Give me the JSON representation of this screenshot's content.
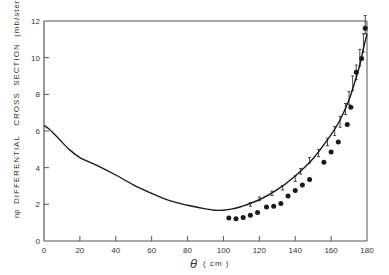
{
  "chart_data": {
    "type": "line",
    "title": "",
    "xlabel": "θ (cm)",
    "ylabel": "np DIFFERENTIAL CROSS SECTION (mb/ster.)",
    "xlim": [
      0,
      180
    ],
    "ylim": [
      0,
      12
    ],
    "x_ticks": [
      "0",
      "20",
      "40",
      "60",
      "80",
      "100",
      "120",
      "140",
      "160",
      "180"
    ],
    "y_ticks": [
      "0",
      "2",
      "4",
      "6",
      "8",
      "10",
      "12"
    ],
    "grid": false,
    "legend": null,
    "series": [
      {
        "name": "theory curve",
        "kind": "line",
        "x": [
          0,
          3,
          8,
          14,
          20,
          30,
          40,
          50,
          60,
          70,
          80,
          90,
          95,
          100,
          105,
          110,
          120,
          130,
          140,
          150,
          160,
          165,
          170,
          173,
          176,
          178,
          180
        ],
        "y": [
          6.3,
          6.1,
          5.6,
          5.0,
          4.55,
          4.1,
          3.6,
          3.05,
          2.6,
          2.2,
          1.95,
          1.75,
          1.68,
          1.68,
          1.75,
          1.88,
          2.25,
          2.8,
          3.55,
          4.5,
          5.8,
          6.6,
          7.7,
          8.6,
          9.6,
          10.5,
          11.3
        ]
      },
      {
        "name": "open points (error bars)",
        "kind": "errorbar",
        "x": [
          115,
          120,
          127,
          133,
          140,
          143,
          148,
          153,
          158,
          162,
          165,
          168,
          170,
          172,
          174,
          176,
          178,
          179
        ],
        "y": [
          2.0,
          2.3,
          2.6,
          2.9,
          3.4,
          3.8,
          4.4,
          4.8,
          5.4,
          6.0,
          6.5,
          7.2,
          7.8,
          8.6,
          9.2,
          10.0,
          10.8,
          11.8
        ],
        "err": [
          0.1,
          0.1,
          0.12,
          0.12,
          0.15,
          0.15,
          0.15,
          0.2,
          0.2,
          0.25,
          0.3,
          0.3,
          0.35,
          0.4,
          0.4,
          0.45,
          0.5,
          0.5
        ]
      },
      {
        "name": "filled points",
        "kind": "scatter",
        "x": [
          103,
          107,
          111,
          115,
          119,
          124,
          128,
          132,
          136,
          140,
          144,
          148,
          156,
          160,
          164,
          169,
          171,
          174,
          177,
          179
        ],
        "y": [
          1.25,
          1.22,
          1.28,
          1.4,
          1.55,
          1.85,
          1.9,
          2.05,
          2.45,
          2.75,
          3.05,
          3.35,
          4.3,
          4.85,
          5.4,
          6.35,
          7.3,
          9.2,
          9.95,
          11.6
        ]
      }
    ]
  },
  "axes": {
    "xlabel_symbol": "θ",
    "xlabel_unit": "( cm )",
    "ylabel_prefix": "np",
    "ylabel_main": "DIFFERENTIAL   CROSS  SECTION  (mb/ster.)"
  },
  "colors": {
    "ink": "#1a1a1a",
    "axis": "#555555",
    "background": "#ffffff"
  }
}
